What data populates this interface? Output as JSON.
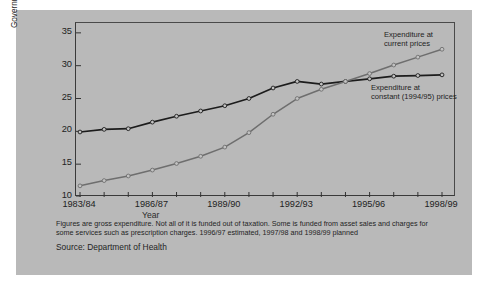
{
  "figure": {
    "background_color": "#b9b9b9",
    "frame_color": "#4a4a4a"
  },
  "footnote": {
    "line1": "Figures are gross expenditure. Not all of it is funded out of taxation. Some is funded from asset sales and charges for",
    "line2": "some services such as prescription charges. 1996/97 estimated, 1997/98 and 1998/99 planned",
    "source": "Source: Department of Health"
  },
  "annotations": {
    "current_line1": "Expenditure at",
    "current_line2": "current prices",
    "constant_line1": "Expenditure at",
    "constant_line2": "constant (1994/95) prices"
  },
  "axis": {
    "ylabel_line1": "Government expenditure",
    "ylabel_line2": "(£ billion)",
    "xlabel": "Year"
  },
  "chart_data": {
    "type": "line",
    "title": "",
    "xlabel": "Year",
    "ylabel": "Government expenditure (£ billion)",
    "ylim": [
      10,
      36.5
    ],
    "yticks": [
      10,
      15,
      20,
      25,
      30,
      35
    ],
    "ytick_labels": [
      "10",
      "15",
      "20",
      "25",
      "30",
      "35"
    ],
    "x": [
      "1983/84",
      "1984/85",
      "1985/86",
      "1986/87",
      "1987/88",
      "1988/89",
      "1989/90",
      "1990/91",
      "1991/92",
      "1992/93",
      "1993/94",
      "1994/95",
      "1995/96",
      "1996/97",
      "1997/98",
      "1998/99"
    ],
    "xtick_labels": [
      "1983/84",
      "1986/87",
      "1989/90",
      "1992/93",
      "1995/96",
      "1998/99"
    ],
    "xtick_indices": [
      0,
      3,
      6,
      9,
      12,
      15
    ],
    "grid": false,
    "legend_position": "inline-annotation",
    "series": [
      {
        "name": "Expenditure at constant (1994/95) prices",
        "color": "#1c1c1c",
        "marker": "circle",
        "values": [
          19.9,
          20.3,
          20.4,
          21.4,
          22.3,
          23.1,
          23.9,
          25.0,
          26.6,
          27.6,
          27.2,
          27.6,
          28.0,
          28.4,
          28.5,
          28.6
        ]
      },
      {
        "name": "Expenditure at current prices",
        "color": "#6e6e6e",
        "marker": "circle",
        "values": [
          11.7,
          12.5,
          13.2,
          14.1,
          15.1,
          16.2,
          17.6,
          19.8,
          22.6,
          25.0,
          26.4,
          27.6,
          28.8,
          30.1,
          31.3,
          32.5
        ]
      }
    ]
  }
}
